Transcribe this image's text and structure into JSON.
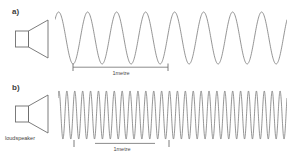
{
  "figure": {
    "background_color": "#ffffff",
    "stroke_color": "#6e6e6e",
    "text_color": "#3d3d3d",
    "width": 290,
    "height": 161
  },
  "panels": [
    {
      "id": "a",
      "label": "a)",
      "speaker_icon": "loudspeaker-icon",
      "wave": {
        "cycles": 8,
        "amplitude": 26,
        "baseline_y": 38,
        "x_start": 57,
        "x_end": 286,
        "description": "low frequency sine wave, long wavelength"
      },
      "scale": {
        "caption": "1metre",
        "x_start": 73,
        "x_end": 167,
        "span_cycles": 3
      }
    },
    {
      "id": "b",
      "label": "b)",
      "speaker_icon": "loudspeaker-icon",
      "wave": {
        "cycles": 29,
        "amplitude": 24,
        "baseline_y": 113,
        "x_start": 60,
        "x_end": 286,
        "description": "high frequency sine wave, short wavelength"
      },
      "scale": {
        "caption": "1metre",
        "x_start": 74,
        "x_end": 168,
        "span_cycles": 12
      }
    }
  ],
  "annotations": {
    "loudspeaker_caption": "loudspeaker"
  }
}
